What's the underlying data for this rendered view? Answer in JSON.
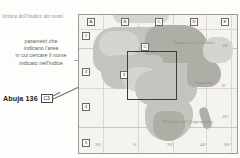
{
  "figure": {
    "title": "lettura dell'indice dei nomi",
    "callout_lines": [
      "parametri che",
      "indicano l'area",
      "in cui cercare il nome",
      "indicato nell'indice"
    ]
  },
  "index_entry": {
    "name": "Abuja",
    "page": "136",
    "grid_ref": "C3"
  },
  "map": {
    "columns": [
      "A",
      "B",
      "C",
      "D",
      "E"
    ],
    "rows": [
      "2",
      "3",
      "4",
      "5"
    ],
    "inner_marks": [
      "C",
      "3"
    ],
    "labels": [
      "Tropico del Cancro",
      "Equatore",
      "Tropico del Capricorno"
    ],
    "longitude_ticks": [
      "20°",
      "0°",
      "20°",
      "40°",
      "60°"
    ],
    "latitude_ticks": [
      "20°",
      "0°",
      "20°"
    ],
    "highlight_ref": "C3"
  },
  "colors": {
    "land": "#c4c3bd",
    "land_dark": "#aeada6",
    "land_light": "#d5d4ce",
    "sea": "#f4f3f0",
    "frame": "#9a9a95",
    "highlight": "#3d3d3a",
    "text": "#8d8c87"
  }
}
